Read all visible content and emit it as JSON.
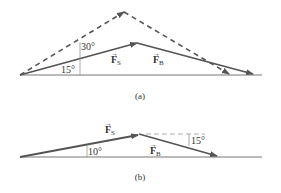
{
  "colors": {
    "vector": "#555555",
    "axis": "#777777",
    "dashed": "#555555",
    "guide": "#888888",
    "background": "#ffffff"
  },
  "panel_a": {
    "caption": "(a)",
    "angle_small": "15°",
    "angle_large": "30°",
    "vector_s": {
      "symbol": "F",
      "subscript": "S"
    },
    "vector_b": {
      "symbol": "F",
      "subscript": "B"
    }
  },
  "panel_b": {
    "caption": "(b)",
    "angle_left": "10°",
    "angle_right": "15°",
    "vector_s": {
      "symbol": "F",
      "subscript": "S"
    },
    "vector_b": {
      "symbol": "F",
      "subscript": "B"
    }
  }
}
